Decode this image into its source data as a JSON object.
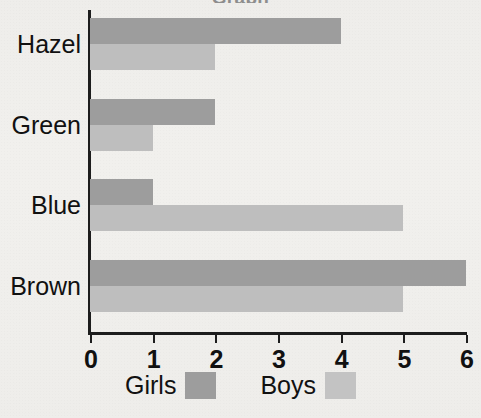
{
  "chart_data": {
    "type": "bar",
    "orientation": "horizontal",
    "title": "Graph",
    "xlabel": "",
    "ylabel": "",
    "categories": [
      "Hazel",
      "Green",
      "Blue",
      "Brown"
    ],
    "series": [
      {
        "name": "Girls",
        "values": [
          4,
          2,
          1,
          6
        ],
        "color": "#9d9d9d"
      },
      {
        "name": "Boys",
        "values": [
          2,
          1,
          5,
          5
        ],
        "color": "#bebebe"
      }
    ],
    "xlim": [
      0,
      6
    ],
    "xticks": [
      "0",
      "1",
      "2",
      "3",
      "4",
      "5",
      "6"
    ],
    "grid": false,
    "legend_position": "bottom",
    "legend": [
      {
        "label": "Girls",
        "color": "#9d9d9d"
      },
      {
        "label": "Boys",
        "color": "#c3c3c3"
      }
    ],
    "background_color": "#f1f0ed",
    "axis_color": "#1d1d1d",
    "text_color": "#111111"
  }
}
